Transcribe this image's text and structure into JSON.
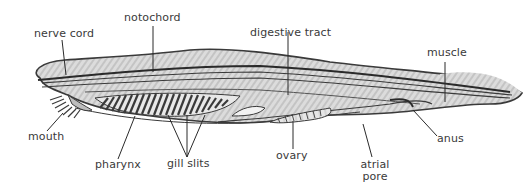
{
  "figure": {
    "colors": {
      "background": "#ffffff",
      "body_fill": "#d9d9d9",
      "outline": "#3a3a3a",
      "label_text": "#3a3a3a",
      "leader_line": "#2a2a2a"
    }
  },
  "labels": {
    "nerve_cord": "nerve cord",
    "notochord": "notochord",
    "digestive_tract": "digestive tract",
    "muscle": "muscle",
    "mouth": "mouth",
    "pharynx": "pharynx",
    "gill_slits": "gill slits",
    "ovary": "ovary",
    "atrial_pore_line1": "atrial",
    "atrial_pore_line2": "pore",
    "anus": "anus"
  }
}
